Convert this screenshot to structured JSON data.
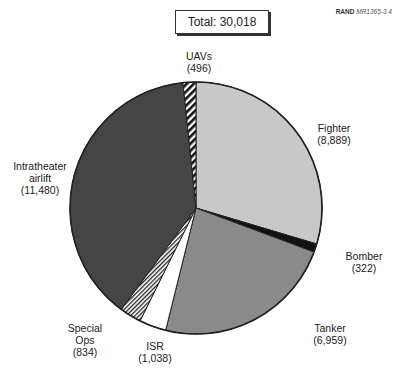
{
  "header": {
    "total_label": "Total: 30,018",
    "credit_org": "RAND",
    "credit_id": "MR1365-3.4"
  },
  "chart_data": {
    "type": "pie",
    "title": "Total: 30,018",
    "total": 30018,
    "start_angle_deg": 0,
    "direction": "clockwise",
    "slices": [
      {
        "name": "Fighter",
        "value": 8889,
        "value_label": "(8,889)",
        "fill": "#c8c8c8",
        "pattern": "solid"
      },
      {
        "name": "Bomber",
        "value": 322,
        "value_label": "(322)",
        "fill": "#111111",
        "pattern": "solid"
      },
      {
        "name": "Tanker",
        "value": 6959,
        "value_label": "(6,959)",
        "fill": "#8a8a8a",
        "pattern": "solid"
      },
      {
        "name": "ISR",
        "value": 1038,
        "value_label": "(1,038)",
        "fill": "#ffffff",
        "pattern": "solid"
      },
      {
        "name": "Special Ops",
        "value": 834,
        "value_label": "(834)",
        "fill": "#ffffff",
        "pattern": "fine-diagonal-hatch"
      },
      {
        "name": "Intratheater airlift",
        "value": 11480,
        "value_label": "(11,480)",
        "fill": "#454545",
        "pattern": "solid"
      },
      {
        "name": "UAVs",
        "value": 496,
        "value_label": "(496)",
        "fill": "#ffffff",
        "pattern": "bold-diagonal-hatch"
      }
    ]
  },
  "labels": {
    "fighter": {
      "name": "Fighter",
      "value": "(8,889)"
    },
    "bomber": {
      "name": "Bomber",
      "value": "(322)"
    },
    "tanker": {
      "name": "Tanker",
      "value": "(6,959)"
    },
    "isr": {
      "name": "ISR",
      "value": "(1,038)"
    },
    "special_ops": {
      "name1": "Special",
      "name2": "Ops",
      "value": "(834)"
    },
    "airlift": {
      "name1": "Intratheater",
      "name2": "airlift",
      "value": "(11,480)"
    },
    "uavs": {
      "name": "UAVs",
      "value": "(496)"
    }
  }
}
